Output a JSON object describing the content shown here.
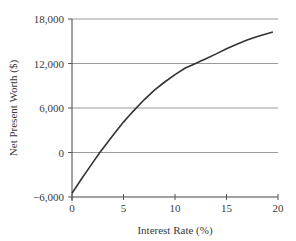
{
  "chart_data": {
    "type": "line",
    "title": "",
    "xlabel": "Interest Rate (%)",
    "ylabel": "Net Present Worth ($)",
    "xlim": [
      0,
      20
    ],
    "ylim": [
      -6000,
      18000
    ],
    "x_ticks": [
      0,
      5,
      10,
      15,
      20
    ],
    "x_tick_labels": [
      "0",
      "5",
      "10",
      "15",
      "20"
    ],
    "y_ticks": [
      -6000,
      0,
      6000,
      12000,
      18000
    ],
    "y_tick_labels": [
      "−6,000",
      "0",
      "6,000",
      "12,000",
      "18,000"
    ],
    "grid": "horizontal",
    "legend": null,
    "series": [
      {
        "name": "Net Present Worth",
        "color": "#333333",
        "x": [
          0,
          1,
          2,
          2.7,
          3,
          4,
          5,
          5.6,
          6,
          7,
          8,
          9,
          10,
          11,
          12,
          12.4,
          13,
          14,
          15,
          16,
          17,
          18,
          19,
          19.5
        ],
        "y": [
          -5500,
          -3400,
          -1400,
          0,
          550,
          2350,
          4100,
          5050,
          5650,
          7100,
          8400,
          9500,
          10500,
          11400,
          12000,
          12250,
          12650,
          13300,
          14000,
          14600,
          15150,
          15650,
          16050,
          16250
        ]
      }
    ]
  }
}
